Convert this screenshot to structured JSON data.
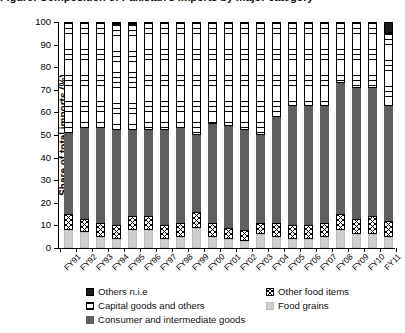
{
  "title_partial": "Figure: Composition of Pakistan's imports by major category",
  "chart_data": {
    "type": "bar",
    "stacked": true,
    "title": "",
    "xlabel": "",
    "ylabel": "Share of total imports (%)",
    "ylim": [
      0,
      100
    ],
    "yticks": [
      0,
      10,
      20,
      30,
      40,
      50,
      60,
      70,
      80,
      90,
      100
    ],
    "grid": false,
    "legend_position": "bottom",
    "categories": [
      "FY91",
      "FY92",
      "FY93",
      "FY94",
      "FY95",
      "FY96",
      "FY97",
      "FY98",
      "FY99",
      "FY00",
      "FY01",
      "FY02",
      "FY03",
      "FY04",
      "FY05",
      "FY06",
      "FY07",
      "FY08",
      "FY09",
      "FY10",
      "FY11"
    ],
    "series": [
      {
        "name": "Food grains",
        "color": "#cfcfcf",
        "pattern": "solid-light-gray",
        "values": [
          8,
          7,
          5,
          4,
          8,
          8,
          4,
          5,
          9,
          5,
          4,
          3,
          6,
          5,
          4,
          4,
          5,
          8,
          6,
          6,
          5
        ]
      },
      {
        "name": "Other food items",
        "color": "#ffffff",
        "pattern": "crosshatch",
        "values": [
          7,
          6,
          6,
          6,
          6,
          6,
          6,
          6,
          7,
          6,
          5,
          5,
          5,
          6,
          6,
          6,
          6,
          7,
          7,
          8,
          7
        ]
      },
      {
        "name": "Consumer and intermediate goods",
        "color": "#5e5e5e",
        "pattern": "solid-dark-gray",
        "values": [
          36,
          40,
          42,
          42,
          38,
          38,
          42,
          42,
          34,
          44,
          45,
          44,
          39,
          47,
          53,
          53,
          52,
          58,
          58,
          57,
          51
        ]
      },
      {
        "name": "Capital goods and others",
        "color": "#ffffff",
        "pattern": "horizontal-lines",
        "values": [
          49,
          47,
          47,
          47,
          47,
          48,
          48,
          47,
          50,
          45,
          46,
          48,
          50,
          42,
          37,
          37,
          37,
          27,
          29,
          29,
          32
        ]
      },
      {
        "name": "Others n.i.e",
        "color": "#1a1a1a",
        "pattern": "solid-black",
        "values": [
          0,
          0,
          0,
          1,
          1,
          0,
          0,
          0,
          0,
          0,
          0,
          0,
          0,
          0,
          0,
          0,
          0,
          0,
          0,
          0,
          5
        ]
      }
    ]
  },
  "legend": {
    "items": [
      {
        "label": "Others n.i.e",
        "key": "others"
      },
      {
        "label": "Other food items",
        "key": "otherfood"
      },
      {
        "label": "Capital goods and others",
        "key": "capital"
      },
      {
        "label": "Food grains",
        "key": "grains"
      },
      {
        "label": "Consumer and intermediate goods",
        "key": "consumer"
      }
    ]
  }
}
